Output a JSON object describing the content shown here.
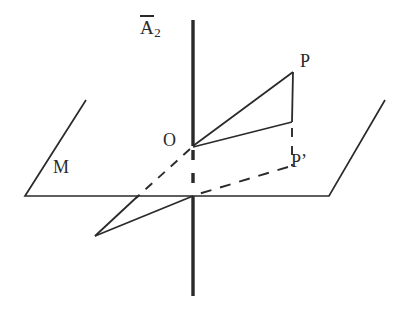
{
  "figure": {
    "background_color": "#ffffff",
    "line_color": "#2a2a2a",
    "labels": {
      "axis": {
        "base": "A",
        "overbar": true,
        "subscript": "2",
        "text": "A̅2"
      },
      "point_p": "P",
      "point_o": "O",
      "point_p_prime": "P’",
      "plane_m": "M"
    },
    "geometry": {
      "axis_top": {
        "x": 193,
        "y": 20
      },
      "axis_bottom": {
        "x": 193,
        "y": 296
      },
      "origin_o": {
        "x": 193,
        "y": 146
      },
      "axis_plane_crossing": {
        "x": 193,
        "y": 196
      },
      "point_p": {
        "x": 293,
        "y": 72
      },
      "corner_below_p": {
        "x": 292,
        "y": 122
      },
      "point_p_prime": {
        "x": 292,
        "y": 163
      },
      "plane_corner_bottom_left": {
        "x": 25,
        "y": 196
      },
      "plane_corner_top_left": {
        "x": 86,
        "y": 100
      },
      "plane_corner_bottom_right": {
        "x": 329,
        "y": 196
      },
      "plane_corner_top_right": {
        "x": 385,
        "y": 100
      },
      "in_plane_apex": {
        "x": 95,
        "y": 236
      },
      "in_plane_edge_break": {
        "x": 138,
        "y": 196
      }
    },
    "strokes": {
      "axis_solid_upper": "solid",
      "axis_dashed_middle": "dashed",
      "axis_solid_lower": "solid",
      "segment_o_to_p": "solid",
      "segment_p_to_corner": "solid",
      "segment_corner_to_o": "solid",
      "segment_corner_to_p_prime": "dashed",
      "segment_o_to_in_plane": "dashed",
      "segment_p_prime_to_axis": "dashed",
      "in_plane_triangle_edges": "solid",
      "plane_outline": "solid"
    }
  }
}
